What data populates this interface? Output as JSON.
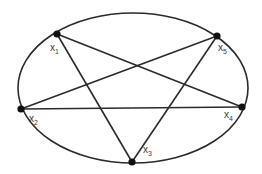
{
  "diagram": {
    "type": "pentagram-in-ellipse",
    "colors": {
      "stroke": "#2b2b2b",
      "node": "#111111",
      "label": "#3a3a3a",
      "background": "#ffffff"
    },
    "ellipse": {
      "cx": 133,
      "cy": 88,
      "rx": 115,
      "ry": 75
    },
    "nodes": [
      {
        "id": "x1",
        "base": "x",
        "sub": "1",
        "x": 57,
        "y": 34,
        "lx": 50,
        "ly": 51
      },
      {
        "id": "x2",
        "base": "x",
        "sub": "2",
        "x": 21,
        "y": 109,
        "lx": 29,
        "ly": 122
      },
      {
        "id": "x3",
        "base": "x",
        "sub": "3",
        "x": 132,
        "y": 162,
        "lx": 143,
        "ly": 153
      },
      {
        "id": "x4",
        "base": "x",
        "sub": "4",
        "x": 242,
        "y": 107,
        "lx": 224,
        "ly": 118
      },
      {
        "id": "x5",
        "base": "x",
        "sub": "5",
        "x": 217,
        "y": 36,
        "lx": 218,
        "ly": 51
      }
    ],
    "edges": [
      [
        "x1",
        "x3"
      ],
      [
        "x1",
        "x4"
      ],
      [
        "x2",
        "x5"
      ],
      [
        "x2",
        "x4"
      ],
      [
        "x3",
        "x5"
      ]
    ]
  }
}
